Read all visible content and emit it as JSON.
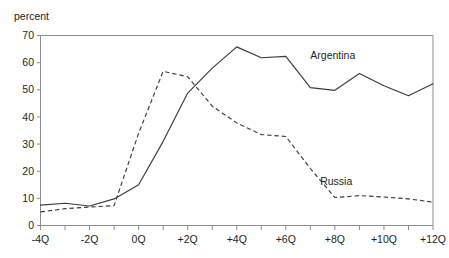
{
  "figure": {
    "unit_label": "percent",
    "cropped_title_fragment": " "
  },
  "chart_data": {
    "type": "line",
    "title": "",
    "subtitle": "",
    "xlabel": "",
    "ylabel": "percent",
    "ylim": [
      0,
      70
    ],
    "ytick_values": [
      0,
      10,
      20,
      30,
      40,
      50,
      60,
      70
    ],
    "ytick_labels": [
      "0",
      "10",
      "20",
      "30",
      "40",
      "50",
      "60",
      "70"
    ],
    "xlim": [
      -4,
      12
    ],
    "xtick_values": [
      -4,
      -3,
      -2,
      -1,
      0,
      1,
      2,
      3,
      4,
      5,
      6,
      7,
      8,
      9,
      10,
      11,
      12
    ],
    "xtick_labels": [
      "-4Q",
      "",
      "-2Q",
      "",
      "0Q",
      "",
      "+2Q",
      "",
      "+4Q",
      "",
      "+6Q",
      "",
      "+8Q",
      "",
      "+10Q",
      "",
      "+12Q"
    ],
    "x": [
      -4,
      -3,
      -2,
      -1,
      0,
      1,
      2,
      3,
      4,
      5,
      6,
      7,
      8,
      9,
      10,
      11,
      12
    ],
    "grid": false,
    "legend_position": "inline-annotation",
    "series": [
      {
        "name": "Argentina",
        "style": "solid",
        "color": "#3c3c3c",
        "label_x": 7.0,
        "label_y": 61.5,
        "values": [
          7.5,
          8.2,
          7.2,
          9.8,
          15.0,
          31.0,
          48.8,
          58.0,
          65.8,
          61.8,
          62.3,
          50.8,
          49.8,
          56.0,
          51.5,
          47.8,
          52.2
        ]
      },
      {
        "name": "Russia",
        "style": "dashed",
        "color": "#3c3c3c",
        "label_x": 7.4,
        "label_y": 15.0,
        "values": [
          5.0,
          6.2,
          6.8,
          7.3,
          34.0,
          56.8,
          54.8,
          44.0,
          37.8,
          33.5,
          32.8,
          21.0,
          10.3,
          11.0,
          10.5,
          9.8,
          8.6
        ]
      }
    ],
    "annotations": [
      {
        "text": "Argentina",
        "x": 7.0,
        "y": 61.5
      },
      {
        "text": "Russia",
        "x": 7.4,
        "y": 15.0
      }
    ]
  }
}
